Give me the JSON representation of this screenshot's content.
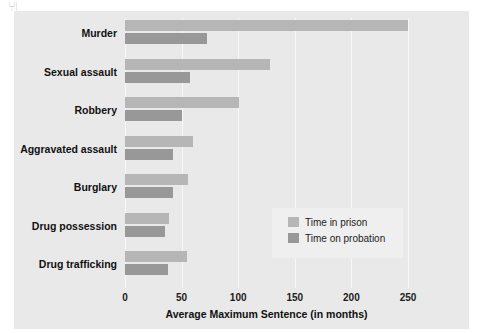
{
  "artifact": {
    "marks": "⑂|"
  },
  "chart_data": {
    "type": "bar",
    "orientation": "horizontal",
    "title": "",
    "xlabel": "Average Maximum Sentence (in months)",
    "ylabel": "",
    "xlim": [
      0,
      250
    ],
    "xticks": [
      0,
      50,
      100,
      150,
      200,
      250
    ],
    "xtick_labels": [
      "0",
      "50",
      "100",
      "150",
      "200",
      "250"
    ],
    "grid": true,
    "grid_axis": "x",
    "legend_position": "center-right-inside",
    "categories": [
      "Murder",
      "Sexual assault",
      "Robbery",
      "Aggravated assault",
      "Burglary",
      "Drug possession",
      "Drug trafficking"
    ],
    "series": [
      {
        "name": "Time in prison",
        "color": "#b6b6b6",
        "values": [
          250,
          128,
          101,
          60,
          56,
          39,
          55
        ]
      },
      {
        "name": "Time on probation",
        "color": "#989898",
        "values": [
          72,
          57,
          50,
          42,
          42,
          35,
          38
        ]
      }
    ]
  },
  "colors": {
    "panel_background": "#e9e9e9",
    "gridline": "#f7f7f7",
    "legend_background": "#efefef",
    "text": "#111111"
  }
}
